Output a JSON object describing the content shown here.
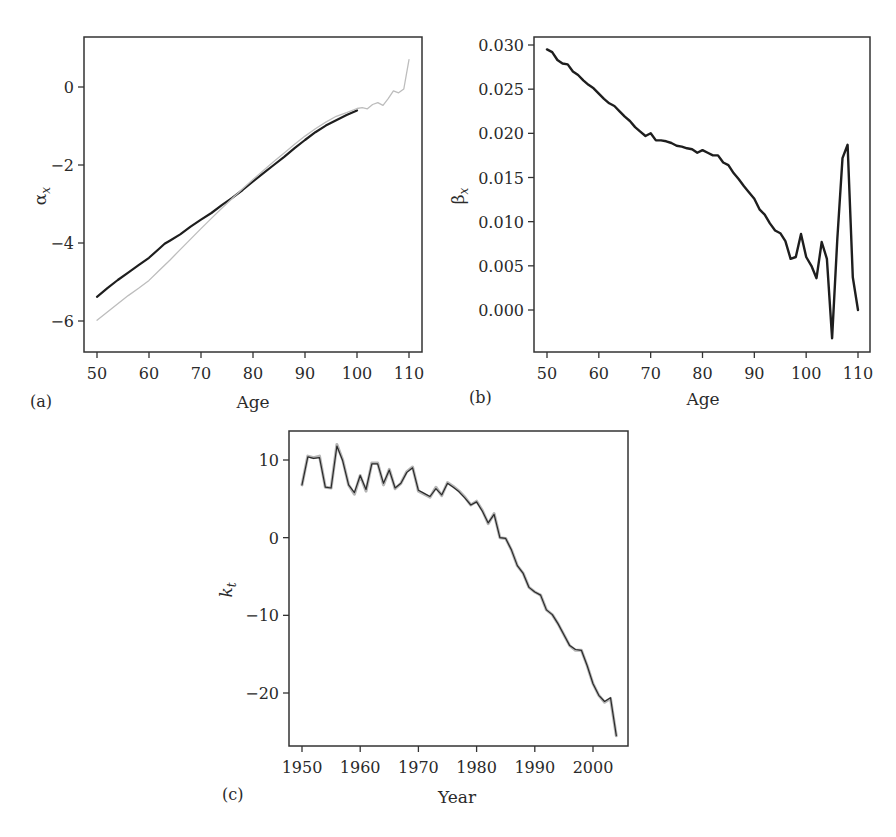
{
  "figure": {
    "panels": [
      "(a)",
      "(b)",
      "(c)"
    ]
  },
  "chart_data": [
    {
      "id": "a",
      "panel_label": "(a)",
      "type": "line",
      "title": "",
      "xlabel": "Age",
      "ylabel": "α",
      "ylabel_subscript": "x",
      "xlim": [
        47.5,
        112.5
      ],
      "ylim": [
        -6.8,
        1.3
      ],
      "xticks": [
        50,
        60,
        70,
        80,
        90,
        100,
        110
      ],
      "yticks": [
        0,
        -2,
        -4,
        -6
      ],
      "ytick_labels": [
        "0",
        "−2",
        "−4",
        "−6"
      ],
      "grid": false,
      "legend": null,
      "series": [
        {
          "name": "fitted (dark)",
          "color": "#1e1e1e",
          "width": 2.2,
          "x": [
            50,
            52,
            54,
            56,
            58,
            60,
            62,
            63,
            64,
            66,
            68,
            70,
            72,
            74,
            76,
            78,
            80,
            82,
            84,
            86,
            88,
            90,
            92,
            94,
            96,
            98,
            100
          ],
          "y": [
            -5.38,
            -5.16,
            -4.95,
            -4.76,
            -4.57,
            -4.38,
            -4.14,
            -4.02,
            -3.94,
            -3.78,
            -3.58,
            -3.4,
            -3.23,
            -3.03,
            -2.84,
            -2.64,
            -2.42,
            -2.21,
            -2.0,
            -1.79,
            -1.57,
            -1.36,
            -1.16,
            -0.99,
            -0.85,
            -0.72,
            -0.6
          ]
        },
        {
          "name": "observed (light)",
          "color": "#bdbdbd",
          "width": 1.3,
          "x": [
            50,
            52,
            54,
            56,
            58,
            60,
            62,
            64,
            66,
            68,
            70,
            72,
            74,
            76,
            78,
            80,
            82,
            84,
            86,
            88,
            90,
            92,
            94,
            96,
            98,
            100,
            101,
            102,
            103,
            104,
            105,
            106,
            107,
            108,
            109,
            110
          ],
          "y": [
            -5.98,
            -5.77,
            -5.56,
            -5.35,
            -5.16,
            -4.96,
            -4.7,
            -4.44,
            -4.17,
            -3.9,
            -3.63,
            -3.37,
            -3.11,
            -2.86,
            -2.61,
            -2.37,
            -2.14,
            -1.91,
            -1.69,
            -1.47,
            -1.26,
            -1.07,
            -0.9,
            -0.75,
            -0.66,
            -0.55,
            -0.53,
            -0.56,
            -0.45,
            -0.4,
            -0.47,
            -0.3,
            -0.1,
            -0.15,
            -0.05,
            0.7
          ]
        }
      ]
    },
    {
      "id": "b",
      "panel_label": "(b)",
      "type": "line",
      "title": "",
      "xlabel": "Age",
      "ylabel": "β",
      "ylabel_subscript": "x",
      "xlim": [
        47.5,
        112.5
      ],
      "ylim": [
        -0.0045,
        0.0315
      ],
      "xticks": [
        50,
        60,
        70,
        80,
        90,
        100,
        110
      ],
      "yticks": [
        0.03,
        0.025,
        0.02,
        0.015,
        0.01,
        0.005,
        0.0
      ],
      "ytick_labels": [
        "0.030",
        "0.025",
        "0.020",
        "0.015",
        "0.010",
        "0.005",
        "0.000"
      ],
      "grid": false,
      "legend": null,
      "series": [
        {
          "name": "beta_x",
          "color": "#1e1e1e",
          "width": 2.4,
          "x": [
            50,
            51,
            52,
            53,
            54,
            55,
            56,
            57,
            58,
            59,
            60,
            61,
            62,
            63,
            64,
            65,
            66,
            67,
            68,
            69,
            70,
            71,
            72,
            73,
            74,
            75,
            76,
            77,
            78,
            79,
            80,
            81,
            82,
            83,
            84,
            85,
            86,
            87,
            88,
            89,
            90,
            91,
            92,
            93,
            94,
            95,
            96,
            97,
            98,
            99,
            100,
            101,
            102,
            103,
            104,
            105,
            106,
            107,
            108,
            109,
            110
          ],
          "y": [
            0.0295,
            0.0292,
            0.0283,
            0.0279,
            0.0278,
            0.027,
            0.0266,
            0.026,
            0.0255,
            0.0251,
            0.0245,
            0.0239,
            0.0234,
            0.0231,
            0.0225,
            0.0219,
            0.0214,
            0.0207,
            0.0202,
            0.0197,
            0.02,
            0.0192,
            0.0192,
            0.0191,
            0.0189,
            0.0186,
            0.0185,
            0.0183,
            0.0182,
            0.0178,
            0.0181,
            0.0178,
            0.0175,
            0.0175,
            0.0167,
            0.0164,
            0.0155,
            0.0148,
            0.014,
            0.0133,
            0.0126,
            0.0114,
            0.0108,
            0.0098,
            0.009,
            0.0087,
            0.0078,
            0.0058,
            0.006,
            0.0086,
            0.006,
            0.005,
            0.0036,
            0.0077,
            0.0058,
            -0.0032,
            0.008,
            0.0172,
            0.0187,
            0.0037,
            0.0
          ]
        }
      ]
    },
    {
      "id": "c",
      "panel_label": "(c)",
      "type": "line",
      "title": "",
      "xlabel": "Year",
      "ylabel": "k",
      "ylabel_subscript": "t",
      "xlim": [
        1948,
        2006
      ],
      "ylim": [
        -26.5,
        13.5
      ],
      "xticks": [
        1950,
        1960,
        1970,
        1980,
        1990,
        2000
      ],
      "yticks": [
        10,
        0,
        -10,
        -20
      ],
      "ytick_labels": [
        "10",
        "0",
        "−10",
        "−20"
      ],
      "grid": false,
      "legend": null,
      "series": [
        {
          "name": "k_t (observed, light)",
          "color": "#b5b5b5",
          "width": 3.0,
          "x": [
            1950,
            1951,
            1952,
            1953,
            1954,
            1955,
            1956,
            1957,
            1958,
            1959,
            1960,
            1961,
            1962,
            1963,
            1964,
            1965,
            1966,
            1967,
            1968,
            1969,
            1970,
            1971,
            1972,
            1973,
            1974,
            1975,
            1976,
            1977,
            1978,
            1979,
            1980,
            1981,
            1982,
            1983,
            1984,
            1985,
            1986,
            1987,
            1988,
            1989,
            1990,
            1991,
            1992,
            1993,
            1994,
            1995,
            1996,
            1997,
            1998,
            1999,
            2000,
            2001,
            2002,
            2003,
            2004
          ],
          "y": [
            6.8,
            10.5,
            10.3,
            10.5,
            6.5,
            6.4,
            12.0,
            10.0,
            6.8,
            5.6,
            8.0,
            6.0,
            9.6,
            9.6,
            6.8,
            8.8,
            6.3,
            7.0,
            8.5,
            9.1,
            6.0,
            5.6,
            5.2,
            6.5,
            5.4,
            7.1,
            6.6,
            6.0,
            5.2,
            4.2,
            4.7,
            3.5,
            1.8,
            3.1,
            0.0,
            -0.1,
            -1.6,
            -3.6,
            -4.6,
            -6.4,
            -7.0,
            -7.4,
            -9.3,
            -9.9,
            -11.1,
            -12.5,
            -13.9,
            -14.5,
            -14.5,
            -16.5,
            -18.8,
            -20.3,
            -21.2,
            -20.7,
            -25.5
          ]
        },
        {
          "name": "k_t (fitted, dark)",
          "color": "#2a2a2a",
          "width": 1.2,
          "x": [
            1950,
            1951,
            1952,
            1953,
            1954,
            1955,
            1956,
            1957,
            1958,
            1959,
            1960,
            1961,
            1962,
            1963,
            1964,
            1965,
            1966,
            1967,
            1968,
            1969,
            1970,
            1971,
            1972,
            1973,
            1974,
            1975,
            1976,
            1977,
            1978,
            1979,
            1980,
            1981,
            1982,
            1983,
            1984,
            1985,
            1986,
            1987,
            1988,
            1989,
            1990,
            1991,
            1992,
            1993,
            1994,
            1995,
            1996,
            1997,
            1998,
            1999,
            2000,
            2001,
            2002,
            2003,
            2004
          ],
          "y": [
            6.8,
            10.4,
            10.2,
            10.3,
            6.5,
            6.4,
            11.8,
            9.9,
            6.8,
            5.8,
            8.0,
            6.2,
            9.5,
            9.5,
            7.0,
            8.7,
            6.4,
            7.0,
            8.4,
            9.0,
            6.1,
            5.7,
            5.3,
            6.3,
            5.5,
            7.0,
            6.5,
            5.9,
            5.1,
            4.2,
            4.6,
            3.4,
            1.9,
            3.0,
            0.0,
            -0.1,
            -1.6,
            -3.6,
            -4.6,
            -6.4,
            -7.0,
            -7.4,
            -9.3,
            -9.9,
            -11.1,
            -12.5,
            -13.9,
            -14.4,
            -14.5,
            -16.5,
            -18.8,
            -20.3,
            -21.1,
            -20.6,
            -25.5
          ]
        }
      ]
    }
  ],
  "layout_px": {
    "a": {
      "frame": [
        84,
        37,
        422,
        352
      ],
      "x0": 50,
      "px0": 97,
      "x1": 110,
      "px1": 409,
      "y0": 0,
      "py0": 87,
      "y1": -6,
      "py1": 321
    },
    "b": {
      "frame": [
        534,
        37,
        870,
        352
      ],
      "x0": 50,
      "px0": 547,
      "x1": 110,
      "px1": 858,
      "y0": 0.03,
      "py0": 45,
      "y1": 0.0,
      "py1": 310
    },
    "c": {
      "frame": [
        289,
        431,
        628,
        746
      ],
      "x0": 1950,
      "px0": 302,
      "x1": 2000,
      "px1": 593,
      "y0": 10,
      "py0": 460,
      "y1": -20,
      "py1": 693
    }
  }
}
